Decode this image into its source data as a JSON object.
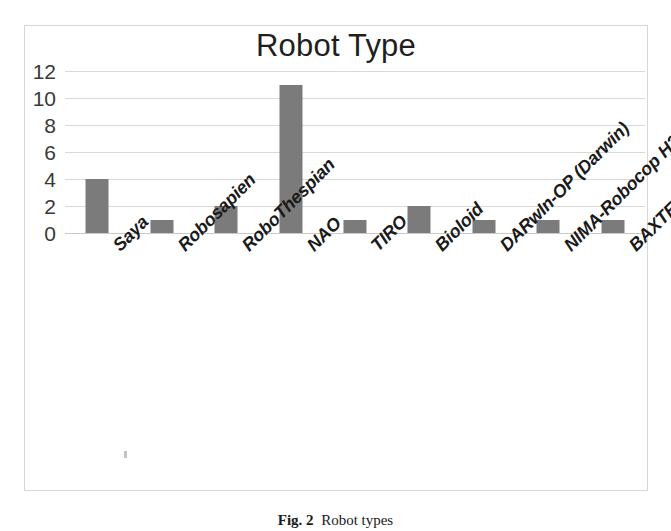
{
  "figure": {
    "caption_label": "Fig. 2",
    "caption_text": "Robot types"
  },
  "chart_data": {
    "type": "bar",
    "title": "Robot Type",
    "xlabel": "",
    "ylabel": "",
    "ylim": [
      0,
      12
    ],
    "yticks": [
      0,
      2,
      4,
      6,
      8,
      10,
      12
    ],
    "ytick_labels": [
      "0",
      "2",
      "4",
      "6",
      "8",
      "10",
      "12"
    ],
    "grid": true,
    "legend": "none",
    "bar_color": "#7b7b7b",
    "gridline_color": "#d9d9d9",
    "plot_border_color": "#d7d7d7",
    "categories": [
      "Saya",
      "Robosapien",
      "RoboThespian",
      "NAO",
      "TIRO",
      "Bioloid",
      "DARwIn-OP (Darwin)",
      "NIMA-Robocop H21 version of NAO",
      "BAXTER"
    ],
    "values": [
      4,
      1,
      2,
      11,
      1,
      2,
      1,
      1,
      1
    ],
    "series": [
      {
        "name": "Robot Type",
        "values": [
          4,
          1,
          2,
          11,
          1,
          2,
          1,
          1,
          1
        ]
      }
    ]
  }
}
